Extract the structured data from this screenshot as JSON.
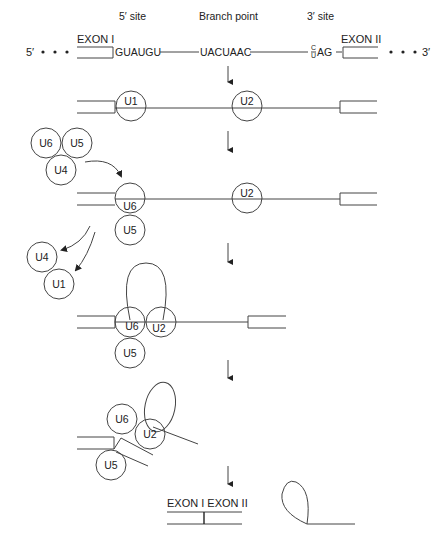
{
  "diagram": {
    "type": "spliceosome-assembly-pathway",
    "headers": {
      "five_prime_site": "5′ site",
      "branch_point": "Branch point",
      "three_prime_site": "3′ site"
    },
    "pre_mrna": {
      "five_end": "5′",
      "three_end": "3′",
      "exon1": "EXON I",
      "exon2": "EXON II",
      "five_site_seq": "GUAUGU",
      "branch_seq": "UACUAAC",
      "three_site_c": "C",
      "three_site_u": "U",
      "three_site_ag": "AG"
    },
    "steps": [
      {
        "id": 1,
        "snrnps": [
          "U1",
          "U2"
        ]
      },
      {
        "id": 2,
        "free_complex": [
          "U6",
          "U5",
          "U4"
        ],
        "bound": [
          "U6",
          "U5",
          "U2"
        ]
      },
      {
        "id": 3,
        "released": [
          "U4",
          "U1"
        ],
        "bound": [
          "U6",
          "U2",
          "U5"
        ]
      },
      {
        "id": 4,
        "bound": [
          "U6",
          "U2",
          "U5"
        ]
      },
      {
        "id": 5,
        "product": "EXON I EXON II",
        "lariat": true
      }
    ],
    "labels": {
      "u1": "U1",
      "u2": "U2",
      "u4": "U4",
      "u5": "U5",
      "u6": "U6",
      "product": "EXON I EXON II"
    }
  }
}
